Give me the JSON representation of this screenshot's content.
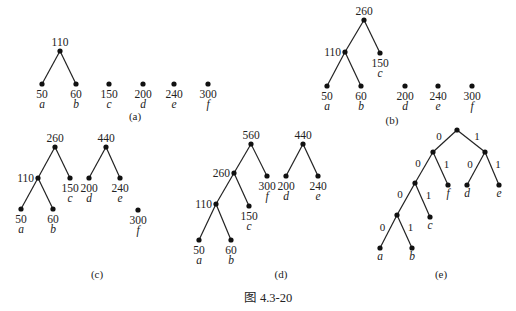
{
  "figure": {
    "title": "图 4.3-20",
    "subfigures": [
      {
        "id": "a",
        "caption": "(a)",
        "nodes": [
          {
            "id": "n110",
            "weight": "110",
            "x": 60,
            "y": 51
          },
          {
            "id": "a",
            "weight": "50",
            "label": "a",
            "x": 42,
            "y": 84
          },
          {
            "id": "b",
            "weight": "60",
            "label": "b",
            "x": 76,
            "y": 84
          },
          {
            "id": "c",
            "weight": "150",
            "label": "c",
            "x": 109,
            "y": 84
          },
          {
            "id": "d",
            "weight": "200",
            "label": "d",
            "x": 143,
            "y": 84
          },
          {
            "id": "e",
            "weight": "240",
            "label": "e",
            "x": 174,
            "y": 84
          },
          {
            "id": "f",
            "weight": "300",
            "label": "f",
            "x": 208,
            "y": 84
          }
        ],
        "edges": [
          [
            "n110",
            "a"
          ],
          [
            "n110",
            "b"
          ]
        ]
      },
      {
        "id": "b",
        "caption": "(b)",
        "nodes": [
          {
            "id": "n260",
            "weight": "260",
            "x": 364,
            "y": 20
          },
          {
            "id": "n110",
            "weight": "110",
            "x": 345,
            "y": 52
          },
          {
            "id": "c",
            "weight": "150",
            "label": "c",
            "x": 380,
            "y": 53
          },
          {
            "id": "a",
            "weight": "50",
            "label": "a",
            "x": 327,
            "y": 86
          },
          {
            "id": "b",
            "weight": "60",
            "label": "b",
            "x": 361,
            "y": 86
          },
          {
            "id": "d",
            "weight": "200",
            "label": "d",
            "x": 405,
            "y": 86
          },
          {
            "id": "e",
            "weight": "240",
            "label": "e",
            "x": 438,
            "y": 86
          },
          {
            "id": "f",
            "weight": "300",
            "label": "f",
            "x": 472,
            "y": 86
          }
        ],
        "edges": [
          [
            "n260",
            "n110"
          ],
          [
            "n260",
            "c"
          ],
          [
            "n110",
            "a"
          ],
          [
            "n110",
            "b"
          ]
        ]
      },
      {
        "id": "c",
        "caption": "(c)",
        "nodes": [
          {
            "id": "n260",
            "weight": "260",
            "x": 55,
            "y": 147
          },
          {
            "id": "n110",
            "weight": "110",
            "x": 38,
            "y": 178
          },
          {
            "id": "c",
            "weight": "150",
            "label": "c",
            "x": 70,
            "y": 178
          },
          {
            "id": "n440",
            "weight": "440",
            "x": 106,
            "y": 147
          },
          {
            "id": "d",
            "weight": "200",
            "label": "d",
            "x": 89,
            "y": 178
          },
          {
            "id": "e",
            "weight": "240",
            "label": "e",
            "x": 120,
            "y": 178
          },
          {
            "id": "a",
            "weight": "50",
            "label": "a",
            "x": 21,
            "y": 209
          },
          {
            "id": "b",
            "weight": "60",
            "label": "b",
            "x": 53,
            "y": 209
          },
          {
            "id": "f",
            "weight": "300",
            "label": "f",
            "x": 138,
            "y": 210
          }
        ],
        "edges": [
          [
            "n260",
            "n110"
          ],
          [
            "n260",
            "c"
          ],
          [
            "n110",
            "a"
          ],
          [
            "n110",
            "b"
          ],
          [
            "n440",
            "d"
          ],
          [
            "n440",
            "e"
          ]
        ]
      },
      {
        "id": "d",
        "caption": "(d)",
        "nodes": [
          {
            "id": "n560",
            "weight": "560",
            "x": 251,
            "y": 144
          },
          {
            "id": "n260",
            "weight": "260",
            "x": 234,
            "y": 173
          },
          {
            "id": "f",
            "weight": "300",
            "label": "f",
            "x": 267,
            "y": 176
          },
          {
            "id": "n110",
            "weight": "110",
            "x": 216,
            "y": 204
          },
          {
            "id": "c",
            "weight": "150",
            "label": "c",
            "x": 249,
            "y": 206
          },
          {
            "id": "a",
            "weight": "50",
            "label": "a",
            "x": 199,
            "y": 240
          },
          {
            "id": "b",
            "weight": "60",
            "label": "b",
            "x": 231,
            "y": 240
          },
          {
            "id": "n440",
            "weight": "440",
            "x": 303,
            "y": 144
          },
          {
            "id": "d",
            "weight": "200",
            "label": "d",
            "x": 286,
            "y": 176
          },
          {
            "id": "e",
            "weight": "240",
            "label": "e",
            "x": 318,
            "y": 176
          }
        ],
        "edges": [
          [
            "n560",
            "n260"
          ],
          [
            "n560",
            "f"
          ],
          [
            "n260",
            "n110"
          ],
          [
            "n260",
            "c"
          ],
          [
            "n110",
            "a"
          ],
          [
            "n110",
            "b"
          ],
          [
            "n440",
            "d"
          ],
          [
            "n440",
            "e"
          ]
        ]
      },
      {
        "id": "e",
        "caption": "(e)",
        "nodes": [
          {
            "id": "root",
            "x": 457,
            "y": 130
          },
          {
            "id": "L",
            "x": 433,
            "y": 152
          },
          {
            "id": "R",
            "x": 485,
            "y": 152
          },
          {
            "id": "LL",
            "x": 415,
            "y": 183
          },
          {
            "id": "f",
            "label": "f",
            "x": 448,
            "y": 185
          },
          {
            "id": "d",
            "label": "d",
            "x": 467,
            "y": 185
          },
          {
            "id": "e",
            "label": "e",
            "x": 499,
            "y": 185
          },
          {
            "id": "LLL",
            "x": 397,
            "y": 215
          },
          {
            "id": "c",
            "label": "c",
            "x": 430,
            "y": 217
          },
          {
            "id": "a",
            "label": "a",
            "x": 380,
            "y": 248
          },
          {
            "id": "b",
            "label": "b",
            "x": 412,
            "y": 248
          }
        ],
        "edges": [
          {
            "from": "root",
            "to": "L",
            "bit": "0"
          },
          {
            "from": "root",
            "to": "R",
            "bit": "1"
          },
          {
            "from": "L",
            "to": "LL",
            "bit": "0"
          },
          {
            "from": "L",
            "to": "f",
            "bit": "1"
          },
          {
            "from": "R",
            "to": "d",
            "bit": "0"
          },
          {
            "from": "R",
            "to": "e",
            "bit": "1"
          },
          {
            "from": "LL",
            "to": "LLL",
            "bit": "0"
          },
          {
            "from": "LL",
            "to": "c",
            "bit": "1"
          },
          {
            "from": "LLL",
            "to": "a",
            "bit": "0"
          },
          {
            "from": "LLL",
            "to": "b",
            "bit": "1"
          }
        ]
      }
    ]
  }
}
